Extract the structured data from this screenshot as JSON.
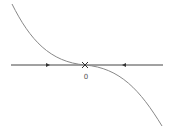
{
  "diagram": {
    "type": "phase-line",
    "curve": {
      "description": "cubic curve decreasing through origin, flat at origin",
      "color": "#888888",
      "path": "M 12 4 C 30 40, 50 62, 85 65 C 120 68, 140 90, 162 126"
    },
    "axis": {
      "x_start": 11,
      "x_end": 163,
      "y": 65,
      "color": "#444444"
    },
    "markers": [
      {
        "type": "arrow-right",
        "x": 48,
        "y": 65
      },
      {
        "type": "x-mark",
        "x": 85,
        "y": 65
      },
      {
        "type": "arrow-left",
        "x": 124,
        "y": 65
      }
    ],
    "labels": {
      "origin": "0"
    }
  }
}
